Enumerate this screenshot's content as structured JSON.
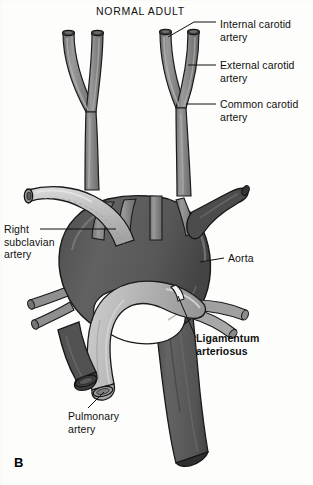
{
  "figure": {
    "title": "NORMAL ADULT",
    "panel_letter": "B",
    "type": "anatomical-illustration",
    "background_color": "#fdfdfb",
    "palette": {
      "aorta_dark": "#595959",
      "aorta_dark_shadow": "#4a4a4a",
      "vessel_mid": "#8a8a8a",
      "vessel_light": "#b9b9b9",
      "vessel_highlight": "#d8d8d8",
      "outline": "#1a1a1a",
      "lumen_dark": "#3d3d3d",
      "lumen_light": "#9b9b9b",
      "ligamentum": "#efefef"
    }
  },
  "labels": {
    "internal_carotid": {
      "text": "Internal carotid\nartery",
      "x": 220,
      "y": 18,
      "bold": false
    },
    "external_carotid": {
      "text": "External carotid\nartery",
      "x": 220,
      "y": 61,
      "bold": false
    },
    "common_carotid": {
      "text": "Common carotid\nartery",
      "x": 220,
      "y": 100,
      "bold": false
    },
    "right_subclavian": {
      "text": "Right\nsubclavian\nartery",
      "x": 4,
      "y": 225,
      "bold": false
    },
    "aorta": {
      "text": "Aorta",
      "x": 228,
      "y": 254,
      "bold": false
    },
    "ligamentum_arteriosus": {
      "text": "Ligamentum\narteriosus",
      "x": 196,
      "y": 334,
      "bold": true
    },
    "pulmonary_artery": {
      "text": "Pulmonary\nartery",
      "x": 68,
      "y": 412,
      "bold": false
    }
  },
  "structures": [
    {
      "name": "left-carotid-bifurcation",
      "shade": "vessel_mid"
    },
    {
      "name": "right-carotid-bifurcation",
      "shade": "vessel_mid"
    },
    {
      "name": "common-carotid-trunk-left",
      "shade": "vessel_mid"
    },
    {
      "name": "common-carotid-trunk-right",
      "shade": "vessel_mid"
    },
    {
      "name": "right-subclavian-artery",
      "shade": "vessel_light"
    },
    {
      "name": "aortic-arch",
      "shade": "aorta_dark"
    },
    {
      "name": "descending-aorta",
      "shade": "aorta_dark"
    },
    {
      "name": "brachiocephalic-branches",
      "shade": "vessel_mid"
    },
    {
      "name": "left-subclavian-branch",
      "shade": "aorta_dark"
    },
    {
      "name": "pulmonary-artery",
      "shade": "vessel_light"
    },
    {
      "name": "ligamentum-arteriosus-band",
      "shade": "ligamentum"
    },
    {
      "name": "aorta-cut-end",
      "shade": "lumen_dark"
    },
    {
      "name": "pulmonary-cut-end",
      "shade": "lumen_light"
    }
  ]
}
